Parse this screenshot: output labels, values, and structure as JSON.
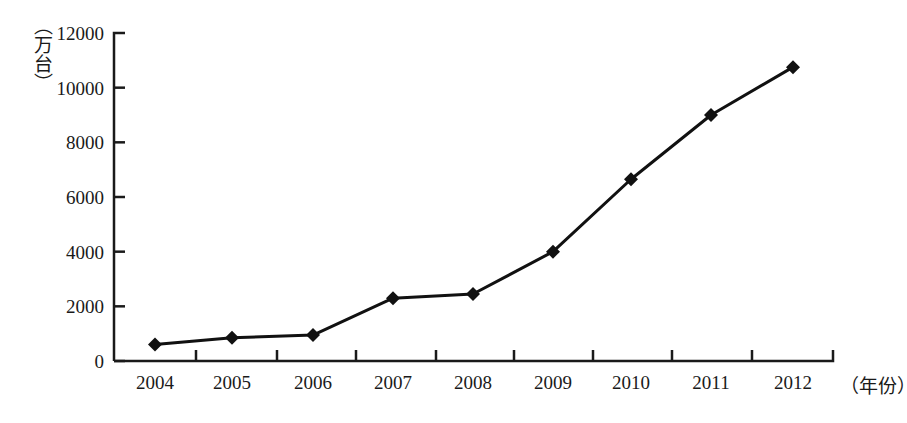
{
  "chart_data": {
    "type": "line",
    "title": "",
    "xlabel": "（年份）",
    "ylabel": "（万台）",
    "categories": [
      "2004",
      "2005",
      "2006",
      "2007",
      "2008",
      "2009",
      "2010",
      "2011",
      "2012"
    ],
    "values": [
      600,
      850,
      950,
      2300,
      2450,
      4000,
      6650,
      9000,
      10750
    ],
    "series": [
      {
        "name": "",
        "values": [
          600,
          850,
          950,
          2300,
          2450,
          4000,
          6650,
          9000,
          10750
        ]
      }
    ],
    "ylim": [
      0,
      12000
    ],
    "yticks": [
      "0",
      "2000",
      "4000",
      "6000",
      "8000",
      "10000",
      "12000"
    ],
    "ytick_values": [
      0,
      2000,
      4000,
      6000,
      8000,
      10000,
      12000
    ],
    "grid": false,
    "legend": false,
    "legend_position": "none",
    "marker": "diamond",
    "line_color": "#111111",
    "marker_color": "#111111",
    "background_color": "#ffffff",
    "axis_color": "#1a1a1a"
  }
}
